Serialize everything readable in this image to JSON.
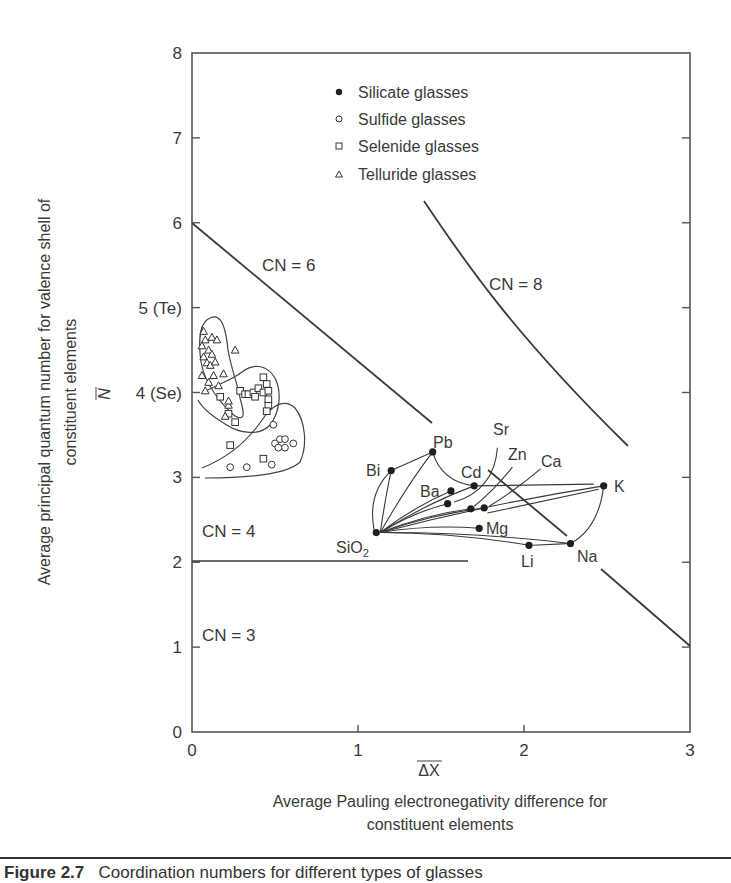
{
  "chart_data": {
    "type": "scatter",
    "title": "",
    "xlabel_symbol": "ΔX (overbar)",
    "xlabel": "Average Pauling electronegativity difference for constituent elements",
    "xlabel_line1": "Average Pauling electronegativity difference for",
    "xlabel_line2": "constituent elements",
    "ylabel_symbol": "N (overbar)",
    "ylabel": "Average principal quantum number for valence shell of constituent elements",
    "ylabel_line1": "Average principal quantum number for valence shell of",
    "ylabel_line2": "constituent elements",
    "xlim": [
      0,
      3
    ],
    "ylim": [
      0,
      8
    ],
    "x_ticks": [
      "0",
      "1",
      "2",
      "3"
    ],
    "y_ticks": [
      "0",
      "1",
      "2",
      "3",
      "4 (Se)",
      "5 (Te)",
      "6",
      "7",
      "8"
    ],
    "grid": false,
    "legend_position": "upper center",
    "legend": [
      {
        "marker": "filled-circle",
        "label": "Silicate glasses"
      },
      {
        "marker": "open-circle",
        "label": "Sulfide glasses"
      },
      {
        "marker": "open-square",
        "label": "Selenide glasses"
      },
      {
        "marker": "open-triangle",
        "label": "Telluride glasses"
      }
    ],
    "region_labels": [
      {
        "label": "CN = 6",
        "x": 0.55,
        "y": 5.4
      },
      {
        "label": "CN = 8",
        "x": 1.8,
        "y": 5.2
      },
      {
        "label": "CN = 4",
        "x": 0.05,
        "y": 2.4
      },
      {
        "label": "CN = 3",
        "x": 0.05,
        "y": 1.2
      }
    ],
    "boundary_lines": [
      {
        "name": "CN 6/4 boundary",
        "points": [
          [
            0,
            6
          ],
          [
            3,
            1
          ]
        ]
      },
      {
        "name": "CN 4/3 boundary",
        "points": [
          [
            0,
            2
          ],
          [
            1.67,
            2
          ]
        ]
      },
      {
        "name": "CN 8/6 boundary",
        "points": [
          [
            1.4,
            6.0
          ],
          [
            1.8,
            5.0
          ],
          [
            2.2,
            4.1
          ],
          [
            2.6,
            3.4
          ]
        ]
      }
    ],
    "series": [
      {
        "name": "Silicate glasses",
        "points": [
          {
            "label": "SiO2",
            "x": 1.11,
            "y": 2.35
          },
          {
            "label": "Bi",
            "x": 1.2,
            "y": 3.08
          },
          {
            "label": "Pb",
            "x": 1.45,
            "y": 3.3
          },
          {
            "label": "Ba",
            "x": 1.56,
            "y": 2.84
          },
          {
            "label": "Cd",
            "x": 1.7,
            "y": 2.9
          },
          {
            "label": "Sr",
            "x": 1.54,
            "y": 2.69
          },
          {
            "label": "Zn",
            "x": 1.68,
            "y": 2.63
          },
          {
            "label": "Ca",
            "x": 1.76,
            "y": 2.64
          },
          {
            "label": "Mg",
            "x": 1.73,
            "y": 2.4
          },
          {
            "label": "Li",
            "x": 2.03,
            "y": 2.2
          },
          {
            "label": "Na",
            "x": 2.28,
            "y": 2.22
          },
          {
            "label": "K",
            "x": 2.48,
            "y": 2.9
          }
        ]
      },
      {
        "name": "Sulfide glasses",
        "points": [
          {
            "x": 0.23,
            "y": 3.12
          },
          {
            "x": 0.33,
            "y": 3.12
          },
          {
            "x": 0.48,
            "y": 3.15
          },
          {
            "x": 0.49,
            "y": 3.62
          },
          {
            "x": 0.5,
            "y": 3.4
          },
          {
            "x": 0.53,
            "y": 3.45
          },
          {
            "x": 0.56,
            "y": 3.45
          },
          {
            "x": 0.52,
            "y": 3.35
          },
          {
            "x": 0.56,
            "y": 3.35
          },
          {
            "x": 0.61,
            "y": 3.4
          }
        ]
      },
      {
        "name": "Selenide glasses",
        "points": [
          {
            "x": 0.17,
            "y": 3.95
          },
          {
            "x": 0.22,
            "y": 3.75
          },
          {
            "x": 0.26,
            "y": 3.65
          },
          {
            "x": 0.29,
            "y": 4.02
          },
          {
            "x": 0.32,
            "y": 3.98
          },
          {
            "x": 0.34,
            "y": 3.98
          },
          {
            "x": 0.37,
            "y": 4.0
          },
          {
            "x": 0.38,
            "y": 3.95
          },
          {
            "x": 0.4,
            "y": 4.05
          },
          {
            "x": 0.43,
            "y": 4.0
          },
          {
            "x": 0.43,
            "y": 4.18
          },
          {
            "x": 0.45,
            "y": 4.1
          },
          {
            "x": 0.46,
            "y": 4.02
          },
          {
            "x": 0.46,
            "y": 3.85
          },
          {
            "x": 0.45,
            "y": 3.78
          },
          {
            "x": 0.43,
            "y": 3.22
          },
          {
            "x": 0.23,
            "y": 3.38
          },
          {
            "x": 0.46,
            "y": 3.92
          }
        ]
      },
      {
        "name": "Telluride glasses",
        "points": [
          {
            "x": 0.07,
            "y": 4.72
          },
          {
            "x": 0.08,
            "y": 4.62
          },
          {
            "x": 0.06,
            "y": 4.55
          },
          {
            "x": 0.1,
            "y": 4.5
          },
          {
            "x": 0.07,
            "y": 4.42
          },
          {
            "x": 0.09,
            "y": 4.35
          },
          {
            "x": 0.12,
            "y": 4.65
          },
          {
            "x": 0.12,
            "y": 4.45
          },
          {
            "x": 0.15,
            "y": 4.62
          },
          {
            "x": 0.11,
            "y": 4.32
          },
          {
            "x": 0.14,
            "y": 4.36
          },
          {
            "x": 0.06,
            "y": 4.2
          },
          {
            "x": 0.1,
            "y": 4.12
          },
          {
            "x": 0.13,
            "y": 4.2
          },
          {
            "x": 0.16,
            "y": 4.08
          },
          {
            "x": 0.08,
            "y": 4.02
          },
          {
            "x": 0.19,
            "y": 4.22
          },
          {
            "x": 0.26,
            "y": 4.5
          },
          {
            "x": 0.22,
            "y": 3.85
          },
          {
            "x": 0.2,
            "y": 3.72
          },
          {
            "x": 0.22,
            "y": 3.9
          }
        ]
      }
    ],
    "arrows_from": "SiO2",
    "arrows_to": [
      "Bi",
      "Pb",
      "Ba",
      "Cd",
      "Sr",
      "Zn",
      "Ca",
      "Mg",
      "Li",
      "Na",
      "K"
    ]
  },
  "caption": {
    "label": "Figure 2.7",
    "text": "Coordination numbers for different types of glasses"
  }
}
